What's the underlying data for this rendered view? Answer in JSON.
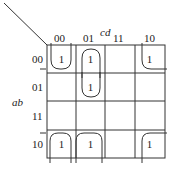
{
  "col_var": "cd",
  "row_var": "ab",
  "col_labels": [
    "00",
    "01",
    "11",
    "10"
  ],
  "row_labels": [
    "00",
    "01",
    "11",
    "10"
  ],
  "cells": [
    [
      "1",
      "1",
      "",
      ""
    ],
    [
      "",
      "1",
      "",
      ""
    ],
    [
      "",
      "",
      "",
      ""
    ],
    [
      "1",
      "1",
      "",
      "1"
    ]
  ],
  "cells_r0c3": "1"
}
